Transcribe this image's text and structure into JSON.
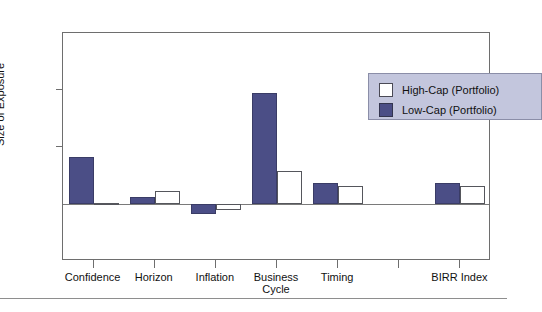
{
  "figure": {
    "clipped_title": "",
    "footer_rule": true
  },
  "chart_data": {
    "type": "bar",
    "title": "",
    "xlabel": "",
    "ylabel": "Size of Exposure",
    "ylim": [
      -2.5,
      7.5
    ],
    "yticks": [
      -2.5,
      0.0,
      2.5,
      5.0,
      7.5
    ],
    "ytick_labels": [
      "-2.5",
      "0.0",
      "2.5",
      "5.0",
      "7.5"
    ],
    "grid": false,
    "legend_position": "upper right",
    "categories": [
      "Confidence",
      "Horizon",
      "Inflation",
      "Business\nCycle",
      "Timing",
      "",
      "BIRR Index"
    ],
    "series": [
      {
        "name": "High-Cap (Portfolio)",
        "color": "#ffffff",
        "values": [
          0.05,
          0.55,
          -0.25,
          1.45,
          0.78,
          null,
          0.78
        ]
      },
      {
        "name": "Low-Cap (Portfolio)",
        "color": "#4b4e86",
        "values": [
          2.05,
          0.3,
          -0.45,
          4.85,
          0.9,
          null,
          0.9
        ]
      }
    ]
  },
  "legend": {
    "entries": [
      {
        "label": "High-Cap (Portfolio)",
        "swatch": "high-cap-swatch"
      },
      {
        "label": "Low-Cap (Portfolio)",
        "swatch": "low-cap-swatch"
      }
    ]
  }
}
